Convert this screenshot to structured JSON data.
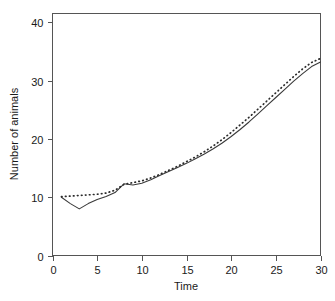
{
  "chart_data": {
    "type": "line",
    "title": "",
    "xlabel": "Time",
    "ylabel": "Number of animals",
    "xlim": [
      0,
      30
    ],
    "ylim": [
      0,
      41.5
    ],
    "xticks": [
      0,
      5,
      10,
      15,
      20,
      25,
      30
    ],
    "yticks": [
      0,
      10,
      20,
      30,
      40
    ],
    "xtick_labels": [
      "0",
      "5",
      "10",
      "15",
      "20",
      "25",
      "30"
    ],
    "ytick_labels": [
      "0",
      "10",
      "20",
      "30",
      "40"
    ],
    "grid": false,
    "legend": "none",
    "frame": "box",
    "x": [
      1,
      2,
      3,
      4,
      5,
      6,
      7,
      8,
      9,
      10,
      11,
      12,
      13,
      14,
      15,
      16,
      17,
      18,
      19,
      20,
      21,
      22,
      23,
      24,
      25,
      26,
      27,
      28,
      29,
      30
    ],
    "series": [
      {
        "name": "observed",
        "style": "solid",
        "color": "#3a3a3a",
        "values": [
          10.0,
          8.9,
          8.0,
          8.9,
          9.6,
          10.1,
          10.8,
          12.3,
          12.1,
          12.4,
          13.0,
          13.7,
          14.4,
          15.1,
          15.8,
          16.6,
          17.4,
          18.3,
          19.3,
          20.4,
          21.6,
          22.9,
          24.3,
          25.7,
          27.1,
          28.5,
          29.9,
          31.2,
          32.4,
          33.2
        ]
      },
      {
        "name": "fitted",
        "style": "dotted",
        "color": "#2b2b2b",
        "values": [
          10.1,
          10.2,
          10.3,
          10.4,
          10.5,
          10.7,
          11.2,
          12.2,
          12.5,
          12.8,
          13.3,
          13.9,
          14.6,
          15.3,
          16.1,
          16.9,
          17.8,
          18.8,
          19.9,
          21.1,
          22.4,
          23.7,
          25.1,
          26.5,
          27.9,
          29.3,
          30.7,
          32.0,
          33.1,
          33.8
        ]
      }
    ]
  },
  "axes": {
    "x_title": "Time",
    "y_title": "Number of animals"
  }
}
